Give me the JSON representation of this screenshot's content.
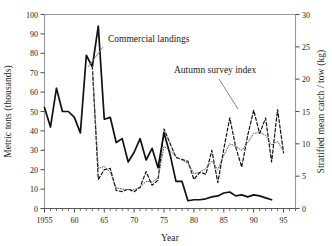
{
  "chart_data": {
    "type": "line",
    "title": "",
    "xlabel": "Year",
    "ylabel": "Metric tons (thousands)",
    "y2label": "Stratified mean catch / tow (kg)",
    "xlim": [
      1955,
      1997
    ],
    "ylim": [
      0,
      100
    ],
    "y2lim": [
      0,
      30
    ],
    "grid": false,
    "legend": "inline-annotations",
    "xticks": [
      1955,
      1960,
      1965,
      1970,
      1975,
      1980,
      1985,
      1990,
      1995
    ],
    "xtick_labels": [
      "1955",
      "60",
      "65",
      "70",
      "75",
      "80",
      "85",
      "90",
      "95"
    ],
    "xminor_step": 1,
    "yticks": [
      0,
      10,
      20,
      30,
      40,
      50,
      60,
      70,
      80,
      90,
      100
    ],
    "ytick_labels": [
      "0",
      "10",
      "20",
      "30",
      "40",
      "50",
      "60",
      "70",
      "80",
      "90",
      "100"
    ],
    "y2ticks": [
      0,
      5,
      10,
      15,
      20,
      25,
      30
    ],
    "y2tick_labels": [
      "0",
      "5",
      "10",
      "15",
      "20",
      "25",
      "30"
    ],
    "series": [
      {
        "name": "Commercial landings",
        "axis": "left",
        "style": "solid",
        "color": "#111111",
        "x": [
          1955,
          1956,
          1957,
          1958,
          1959,
          1960,
          1961,
          1962,
          1963,
          1964,
          1965,
          1966,
          1967,
          1968,
          1969,
          1970,
          1971,
          1972,
          1973,
          1974,
          1975,
          1976,
          1977,
          1978,
          1979,
          1980,
          1981,
          1982,
          1983,
          1984,
          1985,
          1986,
          1987,
          1988,
          1989,
          1990,
          1991,
          1992,
          1993
        ],
        "values": [
          52,
          42,
          62,
          50,
          50,
          47,
          39,
          79,
          73,
          94,
          46,
          47,
          34,
          36,
          24,
          29,
          36,
          25,
          31,
          21,
          39,
          28,
          14,
          14,
          4,
          4.5,
          4.5,
          5,
          6,
          6.5,
          8,
          8.5,
          6.5,
          7,
          6,
          7,
          6.5,
          5.5,
          4.5
        ]
      },
      {
        "name": "Autumn survey index",
        "axis": "right",
        "style": "dashed",
        "color": "#111111",
        "x": [
          1963,
          1964,
          1965,
          1966,
          1967,
          1968,
          1969,
          1970,
          1971,
          1972,
          1973,
          1974,
          1975,
          1976,
          1977,
          1978,
          1979,
          1980,
          1981,
          1982,
          1983,
          1984,
          1985,
          1986,
          1987,
          1988,
          1989,
          1990,
          1991,
          1992,
          1993,
          1994,
          1995
        ],
        "values": [
          22.0,
          4.5,
          6.0,
          6.2,
          2.8,
          2.6,
          3.0,
          2.6,
          3.3,
          5.7,
          3.6,
          4.4,
          12.3,
          10.1,
          7.9,
          7.6,
          7.3,
          4.5,
          5.6,
          5.3,
          9.0,
          4.0,
          9.2,
          14.0,
          9.5,
          6.4,
          11.3,
          15.2,
          11.6,
          14.0,
          7.2,
          15.3,
          8.6
        ]
      },
      {
        "name": "Autumn survey index smoothed",
        "axis": "right",
        "style": "dotted",
        "color": "#555555",
        "x": [
          1963,
          1964,
          1965,
          1966,
          1967,
          1968,
          1969,
          1970,
          1971,
          1972,
          1973,
          1974,
          1975,
          1976,
          1977,
          1978,
          1979,
          1980,
          1981,
          1982,
          1983,
          1984,
          1985,
          1986,
          1987,
          1988,
          1989,
          1990,
          1991,
          1992,
          1993,
          1994,
          1995
        ],
        "values": [
          22.0,
          6.2,
          6.5,
          5.6,
          3.2,
          3.0,
          2.9,
          2.9,
          3.3,
          4.2,
          4.1,
          4.7,
          9.6,
          9.0,
          8.0,
          7.5,
          7.0,
          5.4,
          5.6,
          6.2,
          7.3,
          6.0,
          8.2,
          10.0,
          9.6,
          9.0,
          10.2,
          11.6,
          11.8,
          11.3,
          9.8,
          10.4,
          8.8
        ]
      }
    ],
    "annotations": [
      {
        "text": "Commercial landings",
        "text_x": 108,
        "text_y": 42,
        "leader": [
          [
            103,
            47
          ],
          [
            88,
            67
          ]
        ]
      },
      {
        "text": "Autumn survey index",
        "text_x": 174,
        "text_y": 73,
        "leader": [
          [
            219,
            79
          ],
          [
            238,
            109
          ]
        ]
      }
    ]
  },
  "axes": {
    "left_title": "Metric tons (thousands)",
    "right_title": "Stratified mean catch / tow (kg)",
    "x_title": "Year"
  }
}
